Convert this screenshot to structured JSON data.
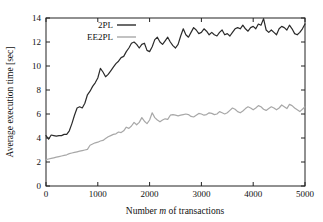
{
  "chart_data": {
    "type": "line",
    "title": "",
    "xlabel": "Number m of transactions",
    "xlabel_parts": {
      "pre": "Number ",
      "italic": "m",
      "post": " of transactions"
    },
    "ylabel": "Average execution time [sec]",
    "xlim": [
      0,
      5000
    ],
    "ylim": [
      0,
      14
    ],
    "xticks": [
      0,
      1000,
      2000,
      3000,
      4000,
      5000
    ],
    "yticks": [
      0,
      2,
      4,
      6,
      8,
      10,
      12,
      14
    ],
    "xtick_labels": [
      "0",
      "1000",
      "2000",
      "3000",
      "4000",
      "5000"
    ],
    "ytick_labels": [
      "0",
      "2",
      "4",
      "6",
      "8",
      "10",
      "12",
      "14"
    ],
    "grid": false,
    "legend_position": "top-left",
    "colors": {
      "2PL": "#2b2b2b",
      "EE2PL": "#a8a8a8",
      "axis": "#222222",
      "background": "#ffffff"
    },
    "series": [
      {
        "name": "2PL",
        "color": "#2b2b2b",
        "x": [
          0,
          50,
          100,
          150,
          200,
          250,
          300,
          350,
          400,
          450,
          500,
          550,
          600,
          650,
          700,
          750,
          800,
          850,
          900,
          950,
          1000,
          1050,
          1100,
          1150,
          1200,
          1250,
          1300,
          1350,
          1400,
          1450,
          1500,
          1550,
          1600,
          1650,
          1700,
          1750,
          1800,
          1850,
          1900,
          1950,
          2000,
          2050,
          2100,
          2150,
          2200,
          2250,
          2300,
          2350,
          2400,
          2450,
          2500,
          2550,
          2600,
          2650,
          2700,
          2750,
          2800,
          2850,
          2900,
          2950,
          3000,
          3050,
          3100,
          3150,
          3200,
          3250,
          3300,
          3350,
          3400,
          3450,
          3500,
          3550,
          3600,
          3650,
          3700,
          3750,
          3800,
          3850,
          3900,
          3950,
          4000,
          4050,
          4100,
          4150,
          4200,
          4250,
          4300,
          4350,
          4400,
          4450,
          4500,
          4550,
          4600,
          4650,
          4700,
          4750,
          4800,
          4850,
          4900,
          4950,
          5000
        ],
        "values": [
          4.2,
          3.9,
          4.25,
          4.2,
          4.15,
          4.2,
          4.2,
          4.3,
          4.3,
          4.6,
          5.2,
          5.9,
          6.5,
          6.6,
          6.5,
          6.9,
          7.6,
          7.9,
          8.3,
          8.6,
          9.0,
          9.8,
          9.5,
          9.1,
          9.3,
          9.6,
          9.9,
          10.2,
          10.4,
          10.7,
          10.8,
          11.2,
          11.5,
          11.9,
          12.0,
          11.8,
          11.5,
          11.8,
          11.9,
          11.3,
          11.2,
          11.6,
          12.2,
          12.4,
          12.0,
          11.8,
          12.1,
          12.4,
          12.0,
          11.7,
          11.5,
          11.8,
          12.5,
          13.1,
          12.6,
          12.4,
          12.8,
          13.2,
          13.0,
          12.7,
          12.8,
          13.1,
          12.9,
          12.6,
          12.8,
          12.6,
          12.5,
          12.8,
          13.0,
          12.6,
          12.7,
          12.5,
          12.8,
          13.1,
          13.2,
          13.1,
          13.4,
          13.1,
          12.9,
          13.2,
          13.3,
          13.1,
          13.5,
          13.4,
          13.95,
          13.0,
          12.8,
          13.0,
          12.8,
          12.6,
          13.1,
          13.3,
          13.2,
          13.0,
          13.4,
          13.1,
          12.7,
          12.6,
          12.8,
          13.1,
          13.5
        ]
      },
      {
        "name": "EE2PL",
        "color": "#a8a8a8",
        "x": [
          0,
          50,
          100,
          150,
          200,
          250,
          300,
          350,
          400,
          450,
          500,
          550,
          600,
          650,
          700,
          750,
          800,
          850,
          900,
          950,
          1000,
          1050,
          1100,
          1150,
          1200,
          1250,
          1300,
          1350,
          1400,
          1450,
          1500,
          1550,
          1600,
          1650,
          1700,
          1750,
          1800,
          1850,
          1900,
          1950,
          2000,
          2050,
          2100,
          2150,
          2200,
          2250,
          2300,
          2350,
          2400,
          2450,
          2500,
          2550,
          2600,
          2650,
          2700,
          2750,
          2800,
          2850,
          2900,
          2950,
          3000,
          3050,
          3100,
          3150,
          3200,
          3250,
          3300,
          3350,
          3400,
          3450,
          3500,
          3550,
          3600,
          3650,
          3700,
          3750,
          3800,
          3850,
          3900,
          3950,
          4000,
          4050,
          4100,
          4150,
          4200,
          4250,
          4300,
          4350,
          4400,
          4450,
          4500,
          4550,
          4600,
          4650,
          4700,
          4750,
          4800,
          4850,
          4900,
          4950,
          5000
        ],
        "values": [
          2.2,
          2.25,
          2.3,
          2.35,
          2.4,
          2.45,
          2.5,
          2.55,
          2.6,
          2.7,
          2.75,
          2.8,
          2.85,
          2.9,
          2.95,
          3.0,
          3.05,
          3.4,
          3.5,
          3.6,
          3.65,
          3.75,
          3.8,
          3.95,
          4.1,
          4.2,
          4.3,
          4.35,
          4.5,
          4.45,
          4.6,
          4.9,
          4.8,
          5.0,
          5.3,
          5.1,
          5.3,
          5.7,
          5.4,
          5.2,
          5.5,
          6.1,
          5.7,
          5.5,
          5.35,
          5.5,
          5.6,
          5.55,
          5.9,
          5.95,
          5.9,
          5.85,
          5.9,
          5.95,
          6.0,
          5.95,
          5.8,
          5.75,
          5.9,
          6.05,
          6.0,
          5.9,
          5.95,
          6.1,
          6.05,
          5.95,
          6.0,
          6.2,
          6.1,
          6.0,
          6.1,
          6.3,
          6.5,
          6.4,
          6.2,
          6.1,
          6.25,
          6.45,
          6.6,
          6.5,
          6.35,
          6.5,
          6.7,
          6.6,
          6.4,
          6.3,
          6.45,
          6.6,
          6.5,
          6.35,
          6.5,
          6.75,
          6.6,
          6.45,
          6.8,
          6.7,
          6.5,
          6.35,
          6.2,
          6.4,
          6.6
        ]
      }
    ],
    "legend": [
      {
        "label": "2PL",
        "color": "#2b2b2b"
      },
      {
        "label": "EE2PL",
        "color": "#a8a8a8"
      }
    ]
  }
}
